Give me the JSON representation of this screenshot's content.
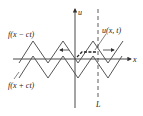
{
  "diagram": {
    "labels": {
      "u_axis": "u",
      "x_axis": "x",
      "f_minus": "f(x − ct)",
      "f_plus": "f(x + ct)",
      "u_xt": "u(x, t)",
      "L": "L"
    },
    "colors": {
      "line": "#333333",
      "background": "#ffffff"
    }
  }
}
